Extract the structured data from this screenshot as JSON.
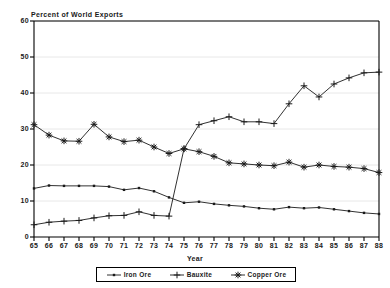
{
  "chart_data": {
    "type": "line",
    "title": "",
    "ylabel": "Percent of World Exports",
    "xlabel": "Year",
    "ylim": [
      0,
      60
    ],
    "yticks": [
      0,
      10,
      20,
      30,
      40,
      50,
      60
    ],
    "grid": true,
    "legend_position": "bottom",
    "categories": [
      "65",
      "66",
      "67",
      "68",
      "69",
      "70",
      "71",
      "72",
      "73",
      "74",
      "75",
      "76",
      "77",
      "78",
      "79",
      "80",
      "81",
      "82",
      "83",
      "84",
      "85",
      "86",
      "87",
      "88"
    ],
    "x": [
      1965,
      1966,
      1967,
      1968,
      1969,
      1970,
      1971,
      1972,
      1973,
      1974,
      1975,
      1976,
      1977,
      1978,
      1979,
      1980,
      1981,
      1982,
      1983,
      1984,
      1985,
      1986,
      1987,
      1988
    ],
    "series": [
      {
        "name": "Iron Ore",
        "marker": "dot",
        "values": [
          13.5,
          14.3,
          14.2,
          14.2,
          14.2,
          14.0,
          13.1,
          13.6,
          12.7,
          11.0,
          9.5,
          9.8,
          9.2,
          8.8,
          8.5,
          8.0,
          7.7,
          8.3,
          8.0,
          8.2,
          7.7,
          7.2,
          6.7,
          6.4
        ]
      },
      {
        "name": "Bauxite",
        "marker": "plus",
        "values": [
          3.4,
          4.1,
          4.4,
          4.6,
          5.3,
          5.9,
          6.0,
          7.0,
          6.0,
          5.8,
          24.5,
          31.2,
          32.3,
          33.4,
          32.0,
          32.0,
          31.5,
          37.0,
          42.0,
          38.9,
          42.5,
          44.2,
          45.6,
          45.8
        ]
      },
      {
        "name": "Copper Ore",
        "marker": "star",
        "values": [
          31.2,
          28.3,
          26.7,
          26.6,
          31.3,
          27.8,
          26.5,
          26.9,
          25.0,
          23.2,
          24.5,
          23.7,
          22.4,
          20.6,
          20.3,
          20.0,
          19.8,
          20.8,
          19.4,
          20.0,
          19.6,
          19.4,
          19.0,
          17.9
        ]
      }
    ],
    "colors": {
      "axis": "#000000",
      "grid": "#e8e8e8",
      "iron_ore": "#1a1a1a",
      "bauxite": "#1a1a1a",
      "copper_ore": "#1a1a1a"
    }
  }
}
